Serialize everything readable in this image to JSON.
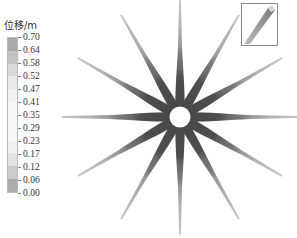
{
  "legend": {
    "title": "位移/m",
    "ticks": [
      "0.70",
      "0.64",
      "0.58",
      "0.52",
      "0.47",
      "0.41",
      "0.35",
      "0.29",
      "0.23",
      "0.17",
      "0.12",
      "0.06",
      "0.00"
    ],
    "bands": [
      "#a9a9a9",
      "#c3c3c3",
      "#d9d9d9",
      "#e9e9e9",
      "#f1f1f1",
      "#f6f6f6",
      "#f8f8f8",
      "#f6f6f6",
      "#f0f0f0",
      "#e2e2e2",
      "#cbcbcb",
      "#ababab"
    ]
  },
  "chart_data": {
    "type": "heatmap",
    "title": "",
    "colorbar_label": "位移/m",
    "colorbar_ticks": [
      0.7,
      0.64,
      0.58,
      0.52,
      0.47,
      0.41,
      0.35,
      0.29,
      0.23,
      0.17,
      0.12,
      0.06,
      0.0
    ],
    "colorbar_range": [
      0.0,
      0.7
    ],
    "geometry": {
      "arms": 12,
      "arm_angles_deg": [
        0,
        30,
        60,
        90,
        120,
        150,
        180,
        210,
        240,
        270,
        300,
        330
      ],
      "center_hole": true,
      "inset": "single arm 3D view"
    },
    "arm_profile": {
      "near_center": "dark (low displacement)",
      "toward_tip": "light (higher displacement)"
    }
  },
  "colors": {
    "arm_dark": "#4a4a4a",
    "arm_mid": "#707070",
    "arm_light": "#9c9c9c",
    "arm_tip": "#c4c4c4",
    "inset_border": "#888888"
  }
}
